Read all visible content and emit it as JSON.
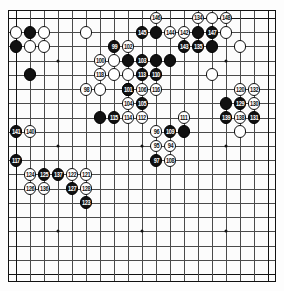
{
  "figure": {
    "type": "go-board-diagram",
    "title": "",
    "size": 19,
    "colors": {
      "black": "#111111",
      "white": "#ffffff",
      "grid": "#4a4a4a",
      "board": "#fcfcfc"
    }
  },
  "chart_data": {
    "type": "table",
    "title": "",
    "xlabel": "",
    "ylabel": "",
    "board_size": 19,
    "legend": [
      "Black stone",
      "White stone",
      "Numbered move"
    ],
    "stones": [
      {
        "c": "w",
        "x": 1,
        "y": 2
      },
      {
        "c": "b",
        "x": 2,
        "y": 2
      },
      {
        "c": "w",
        "x": 3,
        "y": 2
      },
      {
        "c": "w",
        "x": 6,
        "y": 2
      },
      {
        "c": "w",
        "x": 11,
        "y": 1,
        "n": "146"
      },
      {
        "c": "w",
        "x": 14,
        "y": 1,
        "n": "134"
      },
      {
        "c": "w",
        "x": 15,
        "y": 1
      },
      {
        "c": "w",
        "x": 16,
        "y": 1,
        "n": "148"
      },
      {
        "c": "b",
        "x": 1,
        "y": 3
      },
      {
        "c": "w",
        "x": 2,
        "y": 3
      },
      {
        "c": "w",
        "x": 3,
        "y": 3
      },
      {
        "c": "b",
        "x": 10,
        "y": 2,
        "n": "145"
      },
      {
        "c": "b",
        "x": 11,
        "y": 2
      },
      {
        "c": "w",
        "x": 12,
        "y": 2,
        "n": "144"
      },
      {
        "c": "w",
        "x": 13,
        "y": 2,
        "n": "142"
      },
      {
        "c": "b",
        "x": 14,
        "y": 2
      },
      {
        "c": "b",
        "x": 15,
        "y": 2,
        "n": "147"
      },
      {
        "c": "w",
        "x": 16,
        "y": 2
      },
      {
        "c": "b",
        "x": 8,
        "y": 3,
        "n": "99"
      },
      {
        "c": "w",
        "x": 9,
        "y": 3,
        "n": "102"
      },
      {
        "c": "b",
        "x": 13,
        "y": 3,
        "n": "143"
      },
      {
        "c": "b",
        "x": 14,
        "y": 3,
        "n": "135"
      },
      {
        "c": "b",
        "x": 15,
        "y": 3
      },
      {
        "c": "w",
        "x": 17,
        "y": 3
      },
      {
        "c": "w",
        "x": 7,
        "y": 4,
        "n": "100"
      },
      {
        "c": "w",
        "x": 8,
        "y": 4
      },
      {
        "c": "b",
        "x": 9,
        "y": 4
      },
      {
        "c": "b",
        "x": 10,
        "y": 4,
        "n": "103"
      },
      {
        "c": "b",
        "x": 11,
        "y": 4
      },
      {
        "c": "b",
        "x": 12,
        "y": 4
      },
      {
        "c": "b",
        "x": 2,
        "y": 5
      },
      {
        "c": "w",
        "x": 7,
        "y": 5,
        "n": "118"
      },
      {
        "c": "w",
        "x": 8,
        "y": 5
      },
      {
        "c": "w",
        "x": 9,
        "y": 5
      },
      {
        "c": "b",
        "x": 10,
        "y": 5,
        "n": "113"
      },
      {
        "c": "b",
        "x": 11,
        "y": 5,
        "n": "110"
      },
      {
        "c": "w",
        "x": 15,
        "y": 5
      },
      {
        "c": "b",
        "x": 9,
        "y": 6
      },
      {
        "c": "w",
        "x": 6,
        "y": 6,
        "n": "98"
      },
      {
        "c": "w",
        "x": 7,
        "y": 6
      },
      {
        "c": "b",
        "x": 9,
        "y": 6,
        "n": "101"
      },
      {
        "c": "w",
        "x": 10,
        "y": 6,
        "n": "106"
      },
      {
        "c": "w",
        "x": 11,
        "y": 6,
        "n": "116"
      },
      {
        "c": "w",
        "x": 17,
        "y": 6,
        "n": "120"
      },
      {
        "c": "w",
        "x": 18,
        "y": 6,
        "n": "132"
      },
      {
        "c": "w",
        "x": 9,
        "y": 7,
        "n": "104"
      },
      {
        "c": "b",
        "x": 10,
        "y": 7,
        "n": "105"
      },
      {
        "c": "b",
        "x": 16,
        "y": 7
      },
      {
        "c": "b",
        "x": 17,
        "y": 7,
        "n": "129"
      },
      {
        "c": "w",
        "x": 18,
        "y": 7,
        "n": "130"
      },
      {
        "c": "b",
        "x": 7,
        "y": 8
      },
      {
        "c": "b",
        "x": 8,
        "y": 8,
        "n": "115"
      },
      {
        "c": "w",
        "x": 9,
        "y": 8,
        "n": "114"
      },
      {
        "c": "w",
        "x": 10,
        "y": 8,
        "n": "112"
      },
      {
        "c": "w",
        "x": 13,
        "y": 8,
        "n": "111"
      },
      {
        "c": "b",
        "x": 16,
        "y": 8,
        "n": "139"
      },
      {
        "c": "w",
        "x": 17,
        "y": 8,
        "n": "138"
      },
      {
        "c": "b",
        "x": 18,
        "y": 8,
        "n": "131"
      },
      {
        "c": "b",
        "x": 1,
        "y": 9,
        "n": "141"
      },
      {
        "c": "w",
        "x": 2,
        "y": 9,
        "n": "140"
      },
      {
        "c": "b",
        "x": 12,
        "y": 9,
        "n": "109"
      },
      {
        "c": "w",
        "x": 11,
        "y": 9,
        "n": "96"
      },
      {
        "c": "b",
        "x": 13,
        "y": 9
      },
      {
        "c": "w",
        "x": 17,
        "y": 9
      },
      {
        "c": "w",
        "x": 11,
        "y": 10,
        "n": "95"
      },
      {
        "c": "w",
        "x": 12,
        "y": 10,
        "n": "94"
      },
      {
        "c": "b",
        "x": 11,
        "y": 11,
        "n": "97"
      },
      {
        "c": "w",
        "x": 12,
        "y": 11,
        "n": "108"
      },
      {
        "c": "b",
        "x": 1,
        "y": 11,
        "n": "117"
      },
      {
        "c": "w",
        "x": 2,
        "y": 12,
        "n": "124"
      },
      {
        "c": "b",
        "x": 3,
        "y": 12,
        "n": "125"
      },
      {
        "c": "b",
        "x": 4,
        "y": 12,
        "n": "137"
      },
      {
        "c": "w",
        "x": 5,
        "y": 12,
        "n": "122"
      },
      {
        "c": "w",
        "x": 6,
        "y": 12,
        "n": "121"
      },
      {
        "c": "w",
        "x": 2,
        "y": 13,
        "n": "126"
      },
      {
        "c": "w",
        "x": 3,
        "y": 13,
        "n": "136"
      },
      {
        "c": "b",
        "x": 5,
        "y": 13,
        "n": "127"
      },
      {
        "c": "w",
        "x": 6,
        "y": 13,
        "n": "128"
      },
      {
        "c": "b",
        "x": 6,
        "y": 14,
        "n": "123"
      }
    ],
    "move_numbers_visible": [
      94,
      95,
      96,
      97,
      98,
      99,
      100,
      101,
      102,
      103,
      104,
      105,
      106,
      108,
      109,
      110,
      111,
      112,
      113,
      114,
      115,
      116,
      117,
      118,
      119,
      120,
      121,
      122,
      123,
      124,
      125,
      126,
      127,
      128,
      129,
      130,
      131,
      132,
      134,
      135,
      136,
      137,
      138,
      139,
      140,
      141,
      142,
      143,
      144,
      145,
      146,
      147,
      148,
      149
    ]
  }
}
